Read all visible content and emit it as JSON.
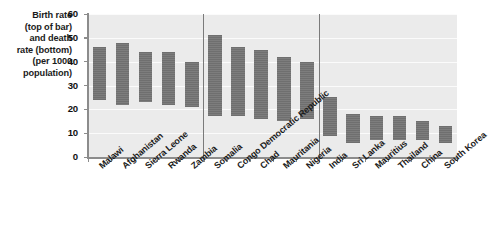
{
  "chart_data": {
    "type": "bar",
    "title": "",
    "ylabel": "Birth rate (top of bar) and death rate (bottom) (per 1000 population)",
    "xlabel": "",
    "ylim": [
      0,
      60
    ],
    "yticks": [
      0,
      10,
      20,
      30,
      40,
      50,
      60
    ],
    "grid": true,
    "legend": false,
    "note": "Each bar is a floating range bar: top edge = birth rate, bottom edge = death rate, per 1000 population. Countries are split into three groups by vertical separator lines.",
    "categories": [
      "Malawi",
      "Afghanistan",
      "Sierra Leone",
      "Rwanda",
      "Zambia",
      "Somalia",
      "Congo Democratic Republic",
      "Chad",
      "Mauritania",
      "Nigeria",
      "India",
      "Sri Lanka",
      "Mauritius",
      "Thailand",
      "China",
      "South Korea"
    ],
    "series": [
      {
        "name": "Birth rate",
        "values": [
          46,
          48,
          44,
          44,
          40,
          51,
          46,
          45,
          42,
          40,
          25,
          18,
          17,
          17,
          15,
          13
        ]
      },
      {
        "name": "Death rate",
        "values": [
          24,
          22,
          23,
          22,
          21,
          17,
          17,
          16,
          15,
          16,
          9,
          6,
          7,
          7,
          7,
          6
        ]
      }
    ],
    "groups": [
      {
        "label": "",
        "start": 0,
        "end": 4
      },
      {
        "label": "",
        "start": 5,
        "end": 9
      },
      {
        "label": "",
        "start": 10,
        "end": 15
      }
    ]
  },
  "axis": {
    "y_caption_lines": [
      "Birth rate",
      "(top of bar)",
      "and death",
      "rate (bottom)",
      "(per 1000",
      "population)"
    ],
    "y_tick_labels": [
      "60",
      "50",
      "40",
      "30",
      "20",
      "10",
      "0"
    ]
  },
  "colors": {
    "plot_background": "#ebebeb",
    "gridline": "#fbfbfb",
    "bar_fill": "#757575",
    "axis": "#8c8c8c",
    "separator": "#7a7a7a",
    "text": "#1b1b1b"
  }
}
